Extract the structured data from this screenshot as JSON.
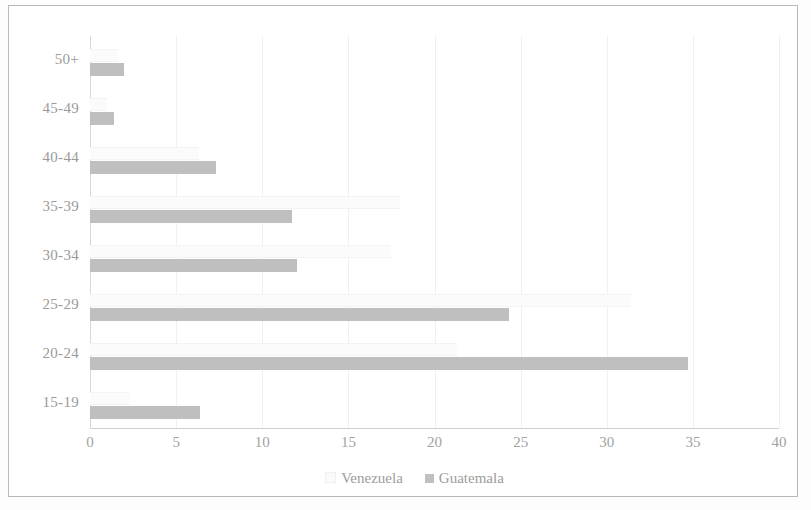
{
  "chart_data": {
    "type": "bar",
    "orientation": "horizontal",
    "title": "",
    "xlabel": "",
    "ylabel": "",
    "categories": [
      "15-19",
      "20-24",
      "25-29",
      "30-34",
      "35-39",
      "40-44",
      "45-49",
      "50+"
    ],
    "series": [
      {
        "name": "Venezuela",
        "color": "#fbfbfb",
        "values": [
          2.3,
          21.3,
          31.4,
          17.5,
          18.0,
          6.3,
          1.0,
          1.6
        ]
      },
      {
        "name": "Guatemala",
        "color": "#bfbfbf",
        "values": [
          6.4,
          34.7,
          24.3,
          12.0,
          11.7,
          7.3,
          1.4,
          2.0
        ]
      }
    ],
    "xlim": [
      0,
      40
    ],
    "xticks": [
      0,
      5,
      10,
      15,
      20,
      25,
      30,
      35,
      40
    ],
    "xtick_labels": [
      "0",
      "5",
      "10",
      "15",
      "20",
      "25",
      "30",
      "35",
      "40"
    ],
    "grid": true,
    "legend_position": "bottom"
  },
  "legend": {
    "items": [
      {
        "label": "Venezuela",
        "swatch": "venezuela"
      },
      {
        "label": "Guatemala",
        "swatch": "guatemala"
      }
    ]
  }
}
